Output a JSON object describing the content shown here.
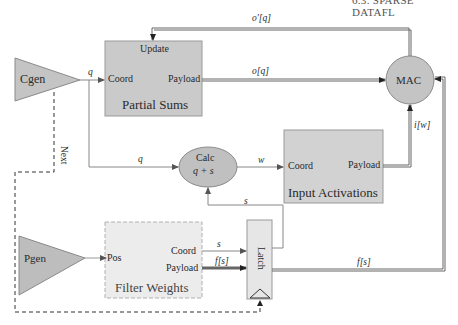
{
  "header": {
    "text": "6.3. SPARSE DATAFL"
  },
  "blocks": {
    "cgen": {
      "label": "Cgen"
    },
    "pgen": {
      "label": "Pgen"
    },
    "partial_sums": {
      "title": "Partial Sums",
      "ports": {
        "update": "Update",
        "coord": "Coord",
        "payload": "Payload"
      }
    },
    "input_activations": {
      "title": "Input Activations",
      "ports": {
        "coord": "Coord",
        "payload": "Payload"
      }
    },
    "filter_weights": {
      "title": "Filter Weights",
      "ports": {
        "pos": "Pos",
        "coord": "Coord",
        "payload": "Payload"
      }
    },
    "calc": {
      "label": "Calc",
      "expr": "q + s"
    },
    "mac": {
      "label": "MAC"
    },
    "latch": {
      "label": "Latch"
    }
  },
  "signals": {
    "q_top": "q",
    "q_mid": "q",
    "w": "w",
    "s_feedback": "s",
    "s_in": "s",
    "f_s_in": "f[s]",
    "f_s_out": "f[s]",
    "o_q": "o[q]",
    "o_prime_q": "o'[q]",
    "i_w": "i[w]",
    "next": "Next"
  },
  "colors": {
    "block_fill": "#c9c9c9",
    "block_fill_light": "#e4e4e4",
    "stroke": "#808080",
    "wire": "#777777"
  }
}
